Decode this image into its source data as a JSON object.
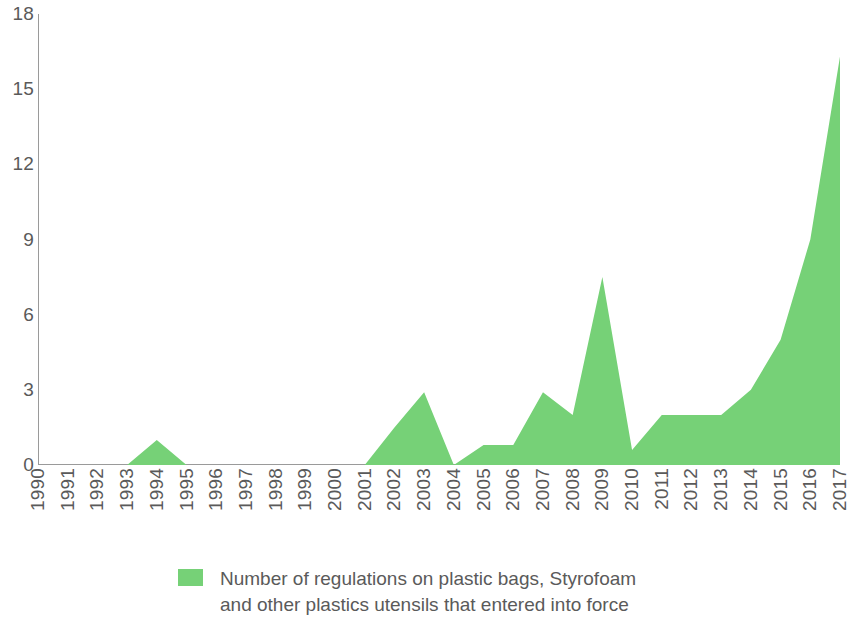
{
  "chart_data": {
    "type": "area",
    "title": "",
    "xlabel": "",
    "ylabel": "",
    "ylim": [
      0,
      18
    ],
    "yticks": [
      0,
      3,
      6,
      9,
      12,
      15,
      18
    ],
    "grid": false,
    "legend_position": "bottom-center",
    "series_color": "#76d177",
    "categories": [
      "1990",
      "1991",
      "1992",
      "1993",
      "1994",
      "1995",
      "1996",
      "1997",
      "1998",
      "1999",
      "2000",
      "2001",
      "2002",
      "2003",
      "2004",
      "2005",
      "2006",
      "2007",
      "2008",
      "2009",
      "2010",
      "2011",
      "2012",
      "2013",
      "2014",
      "2015",
      "2016",
      "2017"
    ],
    "series": [
      {
        "name": "Number of regulations on plastic bags, Styrofoam and other plastics utensils that entered into force",
        "color": "#76d177",
        "values": [
          0,
          0,
          0,
          0,
          1,
          0,
          0,
          0,
          0,
          0,
          0,
          0,
          1.5,
          2.9,
          0,
          0.8,
          0.8,
          2.9,
          2.0,
          7.5,
          0.6,
          2.0,
          2.0,
          2.0,
          3.0,
          5.0,
          9.0,
          16.3
        ]
      }
    ]
  },
  "legend": {
    "line1": "Number of regulations on plastic bags, Styrofoam",
    "line2": "and other plastics utensils that entered into force"
  }
}
